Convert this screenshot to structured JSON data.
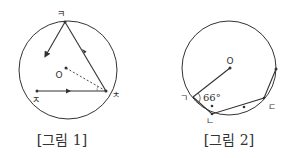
{
  "figure1": {
    "caption": "[그림 1]",
    "points": {
      "top": "ㅋ",
      "right": "ㅊ",
      "left": "ㅈ",
      "center": "O"
    }
  },
  "figure2": {
    "caption": "[그림 2]",
    "points": {
      "a": "ㄱ",
      "b": "ㄴ",
      "c": "ㄷ",
      "center": "O"
    },
    "angle": "66°"
  }
}
